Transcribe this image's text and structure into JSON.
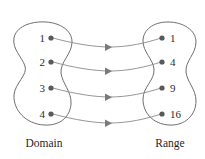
{
  "diagram": {
    "type": "mapping-diagram",
    "stroke_color": "#6e6e6e",
    "connector_color": "#8a8a8a",
    "dot_color": "#595959",
    "text_color": "#2b2b2b",
    "background_color": "#ffffff"
  },
  "domain": {
    "caption": "Domain",
    "caption_x": 44,
    "caption_y": 147,
    "blob_path": "M 46 22 C 30 21 16 27 14 38 C 12 49 22 57 25 66 C 28 75 15 83 14 95 C 13 110 26 124 44 125 C 60 126 70 117 71 104 C 72 92 62 83 61 73 C 60 62 72 54 72 42 C 72 30 60 23 46 22 Z",
    "items": [
      {
        "label": "1",
        "label_x": 45,
        "label_y": 42,
        "dot_x": 51,
        "dot_y": 38
      },
      {
        "label": "2",
        "label_x": 45,
        "label_y": 66,
        "dot_x": 51,
        "dot_y": 62
      },
      {
        "label": "3",
        "label_x": 45,
        "label_y": 92,
        "dot_x": 51,
        "dot_y": 88
      },
      {
        "label": "4",
        "label_x": 45,
        "label_y": 118,
        "dot_x": 51,
        "dot_y": 114
      }
    ]
  },
  "range": {
    "caption": "Range",
    "caption_x": 170,
    "caption_y": 147,
    "blob_path": "M 168 22 C 153 22 143 30 143 41 C 143 52 153 59 154 69 C 155 80 143 87 143 99 C 143 113 153 124 169 125 C 185 126 196 115 196 101 C 196 89 187 82 186 72 C 185 61 196 54 196 42 C 196 30 183 22 168 22 Z",
    "items": [
      {
        "label": "1",
        "label_x": 170,
        "label_y": 42,
        "dot_x": 162,
        "dot_y": 38
      },
      {
        "label": "4",
        "label_x": 170,
        "label_y": 66,
        "dot_x": 162,
        "dot_y": 62
      },
      {
        "label": "9",
        "label_x": 170,
        "label_y": 92,
        "dot_x": 162,
        "dot_y": 88
      },
      {
        "label": "16",
        "label_x": 170,
        "label_y": 118,
        "dot_x": 162,
        "dot_y": 114
      }
    ]
  },
  "mappings": [
    {
      "from": "1",
      "to": "1",
      "path": "M 53 38 C 75 44 95 47 110 47 C 128 47 146 43 161 38",
      "arrow_x": 110,
      "arrow_y": 47
    },
    {
      "from": "2",
      "to": "4",
      "path": "M 53 62 C 75 68 95 71 110 71 C 128 71 146 67 161 62",
      "arrow_x": 110,
      "arrow_y": 71
    },
    {
      "from": "3",
      "to": "9",
      "path": "M 53 88 C 75 94 95 97 110 97 C 128 97 146 93 161 88",
      "arrow_x": 110,
      "arrow_y": 97
    },
    {
      "from": "4",
      "to": "16",
      "path": "M 53 114 C 75 120 95 123 110 123 C 128 123 146 119 161 114",
      "arrow_x": 110,
      "arrow_y": 123
    }
  ]
}
